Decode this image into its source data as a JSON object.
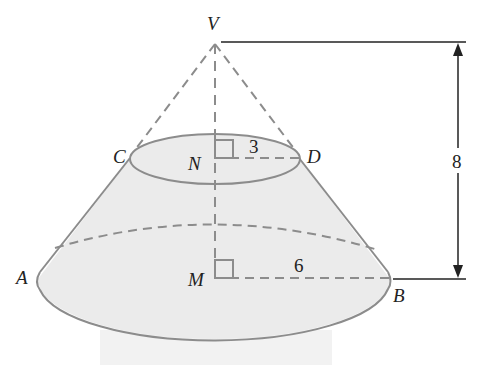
{
  "figure": {
    "type": "frustum-of-cone",
    "points": {
      "apex": "V",
      "top_left": "C",
      "top_right": "D",
      "top_center": "N",
      "bottom_left": "A",
      "bottom_right": "B",
      "bottom_center": "M"
    },
    "measurements": {
      "top_radius": "3",
      "bottom_radius": "6",
      "cone_height": "8"
    },
    "colors": {
      "fill": "#ebebeb",
      "outline": "#8c8c8c",
      "dimension_line": "#222222"
    }
  }
}
